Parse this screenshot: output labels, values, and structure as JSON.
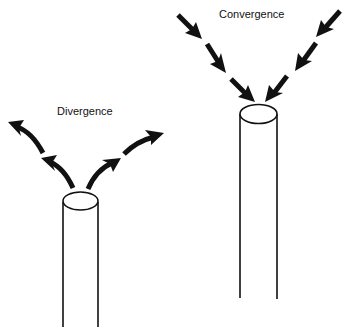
{
  "diagram": {
    "type": "flow-illustration",
    "panels": [
      {
        "id": "divergence",
        "label": "Divergence",
        "description": "Four curved arrows emanating upward and outward from the top of a cylinder",
        "arrow_count": 4,
        "arrow_direction": "outward",
        "arrow_style": "curved"
      },
      {
        "id": "convergence",
        "label": "Convergence",
        "description": "Two chains of three straight arrows pointing inward toward the top of a taller cylinder",
        "arrow_count": 6,
        "arrow_direction": "inward",
        "arrow_style": "straight-segmented"
      }
    ],
    "colors": {
      "ink": "#111111",
      "background": "#ffffff"
    }
  }
}
